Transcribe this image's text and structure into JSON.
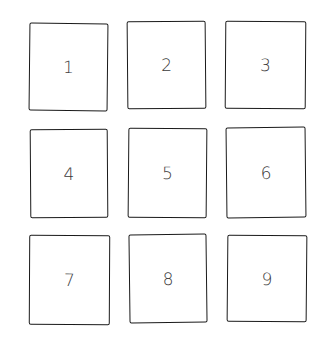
{
  "diagram": {
    "type": "hand-drawn 3x3 grid of numbered boxes",
    "stroke_color": "#1a1a1a",
    "label_color": "#3a3a3a",
    "background": "#ffffff",
    "rows": 3,
    "columns": 3,
    "boxes": [
      {
        "label": "1",
        "row": 1,
        "col": 1
      },
      {
        "label": "2",
        "row": 1,
        "col": 2
      },
      {
        "label": "3",
        "row": 1,
        "col": 3
      },
      {
        "label": "4",
        "row": 2,
        "col": 1
      },
      {
        "label": "5",
        "row": 2,
        "col": 2
      },
      {
        "label": "6",
        "row": 2,
        "col": 3
      },
      {
        "label": "7",
        "row": 3,
        "col": 1
      },
      {
        "label": "8",
        "row": 3,
        "col": 2
      },
      {
        "label": "9",
        "row": 3,
        "col": 3
      }
    ]
  }
}
